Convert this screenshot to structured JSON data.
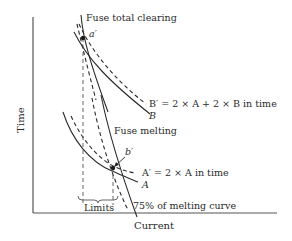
{
  "diagram": {
    "type": "fuse-coordination-time-current",
    "axes": {
      "x_label": "Current",
      "y_label": "Time"
    },
    "curves": {
      "fuse_total_clearing": "Fuse total clearing",
      "fuse_melting": "Fuse melting",
      "melting_75": "75% of melting curve",
      "curve_b_prime": "B′ = 2 × A + 2 × B in time",
      "curve_b": "B",
      "curve_a_prime": "A′ = 2 × A in time",
      "curve_a": "A"
    },
    "points": {
      "a_prime": "a′",
      "b_prime": "b′"
    },
    "limits_label": "Limits",
    "colors": {
      "line": "#2a2a2a",
      "axis": "#555555",
      "background": "#ffffff"
    }
  }
}
